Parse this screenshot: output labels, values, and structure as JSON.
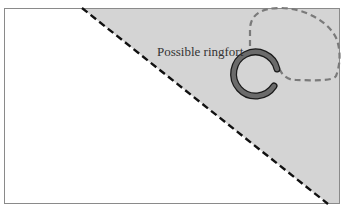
{
  "diagram": {
    "label": "Possible ringfort",
    "colors": {
      "background": "#ffffff",
      "shaded_area": "#d4d4d4",
      "frame": "#8a8a8a",
      "boundary_line": "#111111",
      "ring_fill": "#6b6b6b",
      "ring_outline": "#1a1a1a",
      "dashed_enclosure": "#7a7a7a"
    },
    "elements": [
      {
        "type": "frame",
        "name": "map-frame"
      },
      {
        "type": "shaded-region",
        "name": "shaded-area"
      },
      {
        "type": "dashed-line",
        "name": "diagonal-boundary"
      },
      {
        "type": "ring",
        "name": "ringfort-ring"
      },
      {
        "type": "dashed-loop",
        "name": "dashed-enclosure"
      },
      {
        "type": "text",
        "name": "ringfort-label"
      }
    ]
  }
}
